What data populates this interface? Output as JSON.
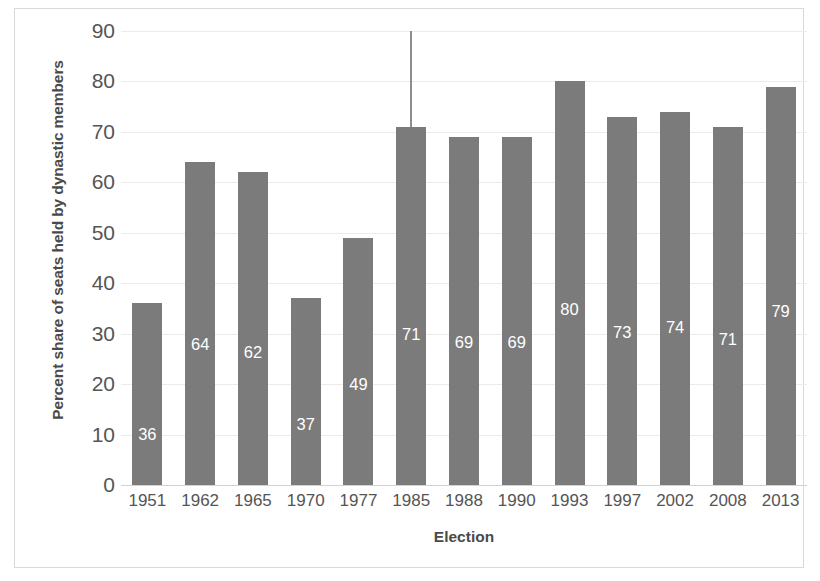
{
  "chart_data": {
    "type": "bar",
    "title": "",
    "xlabel": "Election",
    "ylabel": "Percent share of seats held by dynastic members",
    "categories": [
      "1951",
      "1962",
      "1965",
      "1970",
      "1977",
      "1985",
      "1988",
      "1990",
      "1993",
      "1997",
      "2002",
      "2008",
      "2013"
    ],
    "values": [
      36,
      64,
      62,
      37,
      49,
      71,
      69,
      69,
      80,
      73,
      74,
      71,
      79
    ],
    "value_labels": [
      "36",
      "64",
      "62",
      "37",
      "49",
      "71",
      "69",
      "69",
      "80",
      "73",
      "74",
      "71",
      "79"
    ],
    "ylim": [
      0,
      90
    ],
    "ytick_labels": [
      "90",
      "80",
      "70",
      "60",
      "50",
      "40",
      "30",
      "20",
      "10",
      "0"
    ],
    "ytick_values": [
      90,
      80,
      70,
      60,
      50,
      40,
      30,
      20,
      10,
      0
    ],
    "grid": true,
    "legend": "none",
    "bar_color": "#7b7b7b",
    "gridline_color": "#eceaea",
    "label_text_color": "#ffffff",
    "annotations": [
      {
        "name": "error-bar-1985",
        "category": "1985",
        "from_value": 71,
        "to_value": 90,
        "color": "#8d8d8d"
      }
    ]
  }
}
